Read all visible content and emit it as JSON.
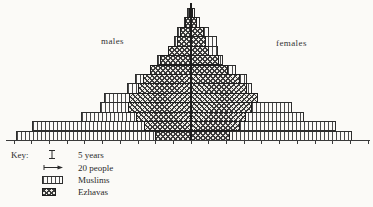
{
  "labels": {
    "males": "males",
    "females": "females"
  },
  "key": {
    "title": "Key:",
    "items": [
      {
        "id": "five-years",
        "symbol": "interval-bar-icon",
        "label": "5 years"
      },
      {
        "id": "twenty-people",
        "symbol": "scale-arrow-icon",
        "label": "20 people"
      },
      {
        "id": "muslims",
        "symbol": "vertical-hatch-swatch",
        "label": "Muslims"
      },
      {
        "id": "ezhavas",
        "symbol": "cross-hatch-swatch",
        "label": "Ezhavas"
      }
    ]
  },
  "chart_data": {
    "type": "bar",
    "variant": "back-to-back population pyramid, stepped outline, hatched scan",
    "title": "",
    "left_label": "males",
    "right_label": "females",
    "age_band_years": 5,
    "people_per_tick": 20,
    "age_bands": [
      "0-4",
      "5-9",
      "10-14",
      "15-19",
      "20-24",
      "25-29",
      "30-34",
      "35-39",
      "40-44",
      "45-49",
      "50-54",
      "55-59",
      "60-64",
      "65-69"
    ],
    "series": [
      {
        "name": "Muslims",
        "pattern": "vertical-hatch",
        "males": [
          205,
          187,
          129,
          107,
          102,
          75,
          66,
          46,
          39,
          25,
          20,
          16,
          8,
          4
        ],
        "females": [
          190,
          171,
          133,
          119,
          79,
          72,
          67,
          53,
          38,
          32,
          31,
          22,
          11,
          5
        ]
      },
      {
        "name": "Ezhavas",
        "pattern": "cross-hatch",
        "males": [
          42,
          55,
          64,
          74,
          72,
          62,
          56,
          48,
          36,
          27,
          16,
          12,
          7,
          2
        ],
        "females": [
          46,
          58,
          65,
          72,
          79,
          67,
          58,
          44,
          34,
          22,
          18,
          16,
          8,
          2
        ]
      }
    ],
    "layout": {
      "baseline_y": 140,
      "apex_y": 8,
      "center_x": 190.6,
      "px_per_person": 0.85,
      "tick_spacing_px": 17.7,
      "grid": "ticks below baseline only",
      "legend_position": "bottom-left"
    },
    "ink_color": "#2b2b2b",
    "paper_color": "#fbfaf7"
  }
}
